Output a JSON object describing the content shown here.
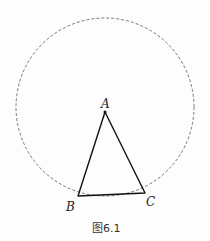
{
  "figure": {
    "caption": "图6.1",
    "circle": {
      "cx": 105,
      "cy": 107,
      "r": 89,
      "style": "dashed"
    },
    "points": [
      {
        "label": "A",
        "x": 105,
        "y": 112
      },
      {
        "label": "B",
        "x": 78,
        "y": 196
      },
      {
        "label": "C",
        "x": 145,
        "y": 193
      }
    ]
  }
}
